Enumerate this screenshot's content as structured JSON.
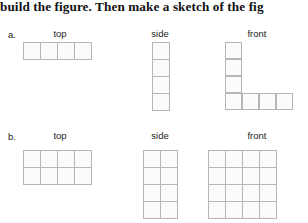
{
  "instruction": {
    "text": "build the figure. Then make a sketch of the fig"
  },
  "rows": [
    {
      "label": "a.",
      "views": [
        {
          "name": "top",
          "label": "top",
          "cols": 4,
          "rows": 1,
          "filled": [
            [
              1,
              1,
              1,
              1
            ]
          ]
        },
        {
          "name": "side",
          "label": "side",
          "cols": 1,
          "rows": 4,
          "filled": [
            [
              1
            ],
            [
              1
            ],
            [
              1
            ],
            [
              1
            ]
          ]
        },
        {
          "name": "front",
          "label": "front",
          "cols": 4,
          "rows": 4,
          "filled": [
            [
              1,
              0,
              0,
              0
            ],
            [
              1,
              0,
              0,
              0
            ],
            [
              1,
              0,
              0,
              0
            ],
            [
              1,
              1,
              1,
              1
            ]
          ]
        }
      ]
    },
    {
      "label": "b.",
      "views": [
        {
          "name": "top",
          "label": "top",
          "cols": 4,
          "rows": 2,
          "filled": [
            [
              1,
              1,
              1,
              1
            ],
            [
              1,
              1,
              1,
              1
            ]
          ]
        },
        {
          "name": "side",
          "label": "side",
          "cols": 2,
          "rows": 4,
          "filled": [
            [
              1,
              1
            ],
            [
              1,
              1
            ],
            [
              1,
              1
            ],
            [
              1,
              1
            ]
          ]
        },
        {
          "name": "front",
          "label": "front",
          "cols": 4,
          "rows": 4,
          "filled": [
            [
              1,
              1,
              1,
              1
            ],
            [
              1,
              1,
              1,
              1
            ],
            [
              1,
              1,
              1,
              1
            ],
            [
              1,
              1,
              1,
              1
            ]
          ]
        }
      ]
    }
  ],
  "colors": {
    "grid_line": "#b6b6b6",
    "cell_fill": "#fbfbfb",
    "text": "#1a1a1a"
  }
}
